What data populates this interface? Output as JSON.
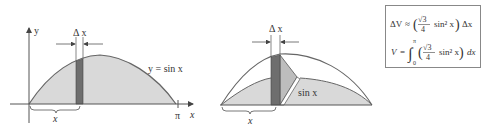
{
  "figure_left": {
    "y_axis_label": "y",
    "x_axis_label": "x",
    "curve_label": "y = sin x",
    "pi_tick_label": "π",
    "strip_width_label": "Δ x",
    "brace_label": "x"
  },
  "figure_right": {
    "strip_width_label": "Δ x",
    "cross_section_label": "sin x",
    "brace_label": "x"
  },
  "formula_box": {
    "line1": {
      "lhs": "ΔV",
      "relation": "≈",
      "coef_numerator": "√3",
      "coef_denominator": "4",
      "term": "sin² x",
      "differential": "Δx"
    },
    "line2": {
      "lhs": "V",
      "relation": "=",
      "integral_lower": "0",
      "integral_upper": "π",
      "coef_numerator": "√3",
      "coef_denominator": "4",
      "term": "sin² x",
      "differential": "dx"
    }
  },
  "colors": {
    "fill_light": "#d9d9d9",
    "strip_dark": "#6e6e6e",
    "triangle_face": "#bdbdbd",
    "stroke": "#555555"
  }
}
